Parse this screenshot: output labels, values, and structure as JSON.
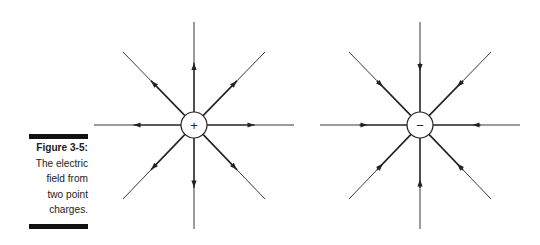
{
  "caption": {
    "label": "Figure 3-5:",
    "lines": [
      "The electric",
      "field from",
      "two point",
      "charges."
    ]
  },
  "diagram": {
    "charges": [
      {
        "sign": "+",
        "name": "positive",
        "field_direction": "outward",
        "center": [
          194,
          125
        ]
      },
      {
        "sign": "−",
        "name": "negative",
        "field_direction": "inward",
        "center": [
          420,
          125
        ]
      }
    ],
    "field_lines_per_charge": 8,
    "colors": {
      "line": "#222222",
      "background": "#ffffff",
      "bar": "#111111"
    }
  }
}
